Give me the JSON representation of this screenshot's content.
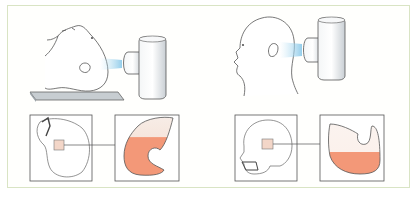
{
  "figure": {
    "panels": [
      {
        "id": "supine",
        "head_position": "supine-lying",
        "device": "cylindrical-stimulator",
        "beam": "light-blue-beam",
        "skull_view": "skull-top-view",
        "detail_view": "fluid-chamber",
        "fluid_level": "high"
      },
      {
        "id": "upright",
        "head_position": "upright-profile",
        "device": "cylindrical-stimulator",
        "beam": "light-blue-beam",
        "skull_view": "skull-side-view",
        "detail_view": "fluid-chamber",
        "fluid_level": "low"
      }
    ]
  },
  "colors": {
    "frame_border": "#d9e4c4",
    "fluid": "#f39878",
    "fluid_top": "#f6e7df",
    "beam": "#a9d7ee",
    "device": "#e9ecef",
    "platform": "#b7bfc5",
    "line": "#555555"
  }
}
